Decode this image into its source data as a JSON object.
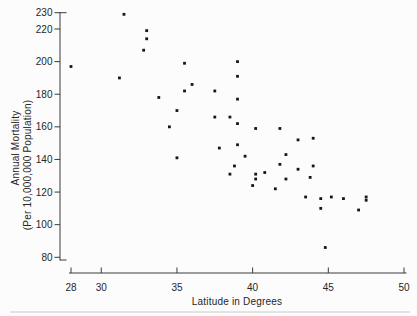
{
  "page": {
    "background": "#fcfcfc",
    "axis_color": "#3a3a3a",
    "marker_color": "#161616",
    "text_color": "#262626"
  },
  "chart_data": {
    "type": "scatter",
    "title": "",
    "xlabel": "Latitude in Degrees",
    "ylabel_line1": "Annual Mortality",
    "ylabel_line2": "(Per 10,000,000 Population)",
    "xlim": [
      28,
      50
    ],
    "ylim": [
      80,
      230
    ],
    "x_ticks": [
      28,
      30,
      35,
      40,
      45,
      50
    ],
    "y_ticks": [
      230,
      220,
      200,
      180,
      160,
      140,
      120,
      100,
      80
    ],
    "grid": false,
    "legend": "none",
    "marker": "small-black-square",
    "points": [
      [
        28.0,
        197
      ],
      [
        31.2,
        190
      ],
      [
        31.5,
        229
      ],
      [
        32.8,
        207
      ],
      [
        33.0,
        219
      ],
      [
        33.0,
        214
      ],
      [
        33.8,
        178
      ],
      [
        34.5,
        160
      ],
      [
        35.0,
        170
      ],
      [
        35.0,
        141
      ],
      [
        35.5,
        199
      ],
      [
        35.5,
        182
      ],
      [
        36.0,
        186
      ],
      [
        37.5,
        182
      ],
      [
        37.5,
        166
      ],
      [
        37.8,
        147
      ],
      [
        38.5,
        166
      ],
      [
        38.5,
        131
      ],
      [
        38.8,
        136
      ],
      [
        39.0,
        200
      ],
      [
        39.0,
        191
      ],
      [
        39.0,
        177
      ],
      [
        39.0,
        162
      ],
      [
        39.0,
        149
      ],
      [
        39.5,
        142
      ],
      [
        40.0,
        124
      ],
      [
        40.2,
        159
      ],
      [
        40.2,
        131
      ],
      [
        40.2,
        128
      ],
      [
        40.8,
        132
      ],
      [
        41.5,
        122
      ],
      [
        41.8,
        159
      ],
      [
        41.8,
        137
      ],
      [
        42.2,
        143
      ],
      [
        42.2,
        128
      ],
      [
        43.0,
        152
      ],
      [
        43.0,
        134
      ],
      [
        43.5,
        117
      ],
      [
        43.8,
        129
      ],
      [
        44.0,
        153
      ],
      [
        44.0,
        136
      ],
      [
        44.5,
        116
      ],
      [
        44.5,
        110
      ],
      [
        44.8,
        86
      ],
      [
        45.2,
        117
      ],
      [
        46.0,
        116
      ],
      [
        47.0,
        109
      ],
      [
        47.5,
        117
      ],
      [
        47.5,
        115
      ]
    ]
  }
}
